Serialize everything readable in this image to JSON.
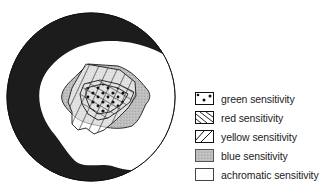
{
  "diagram": {
    "colors": {
      "outer_band": "#1c1c1c",
      "background": "#ffffff",
      "blue_fill": "#b9b9b9",
      "line": "#1a1a1a"
    }
  },
  "legend": {
    "items": [
      {
        "key": "green",
        "label": "green sensitivity",
        "pattern": "dots"
      },
      {
        "key": "red",
        "label": "red sensitivity",
        "pattern": "backslash-hatch"
      },
      {
        "key": "yellow",
        "label": "yellow sensitivity",
        "pattern": "slash-hatch"
      },
      {
        "key": "blue",
        "label": "blue sensitivity",
        "pattern": "gray-stipple"
      },
      {
        "key": "achromatic",
        "label": "achromatic sensitivity",
        "pattern": "blank"
      }
    ]
  }
}
